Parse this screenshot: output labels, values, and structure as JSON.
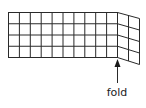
{
  "diagram": {
    "main_grid": {
      "columns": 10,
      "rows": 4
    },
    "folded_flap": {
      "columns": 2,
      "rows": 4
    },
    "annotation": {
      "label": "fold",
      "arrow": "up"
    },
    "colors": {
      "line": "#2a2a2a",
      "background": "#ffffff"
    }
  }
}
